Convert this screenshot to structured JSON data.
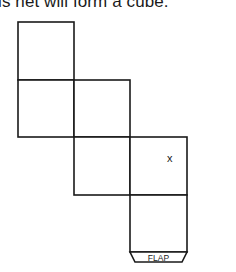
{
  "caption": "This net will form a cube.",
  "net": {
    "faces": [
      {
        "id": "face-1",
        "col": 0,
        "row": 0
      },
      {
        "id": "face-2",
        "col": 0,
        "row": 1
      },
      {
        "id": "face-3",
        "col": 1,
        "row": 1
      },
      {
        "id": "face-4",
        "col": 1,
        "row": 2
      },
      {
        "id": "face-5",
        "col": 2,
        "row": 2,
        "mark": "x"
      },
      {
        "id": "face-6",
        "col": 2,
        "row": 3
      }
    ],
    "marked_face_label": "x",
    "flap_label": "FLAP",
    "stroke_color": "#1a1a1a",
    "fill_color": "#ffffff"
  }
}
